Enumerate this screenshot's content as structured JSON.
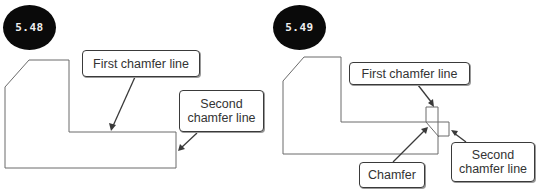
{
  "figures": [
    {
      "id": "5.48",
      "badge": "5.48",
      "labels": {
        "first": "First chamfer line",
        "second_line1": "Second",
        "second_line2": "chamfer line"
      }
    },
    {
      "id": "5.49",
      "badge": "5.49",
      "labels": {
        "first": "First chamfer line",
        "second_line1": "Second",
        "second_line2": "chamfer line",
        "chamfer": "Chamfer"
      }
    }
  ],
  "colors": {
    "badge_bg": "#0a0a0a",
    "badge_text": "#f0f0f0",
    "outline": "#6b6b6b",
    "callout_border": "#3a3a3a",
    "text": "#333333"
  }
}
